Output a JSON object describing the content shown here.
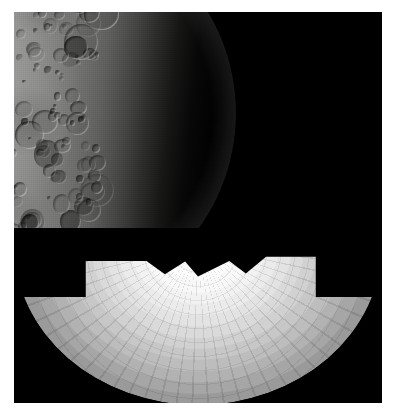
{
  "image": {
    "kind": "astronomical-composite",
    "background_color": "#ffffff",
    "field_color": "#000000",
    "frame": {
      "x": 14,
      "y": 12,
      "width": 368,
      "height": 391
    }
  },
  "upper_object": {
    "name": "cratered-moon",
    "description": "Heavily cratered icy moon, illuminated left hemisphere, terminator on the right",
    "illumination": "left-lit",
    "terminator_side": "right",
    "surface_tone_light": "#bcbcba",
    "surface_tone_mid": "#8a8a88",
    "surface_tone_dark": "#2b2b2a",
    "limb_highlight": "#d8d8d6",
    "bottom_edge": "truncated",
    "features": [
      {
        "name": "elongated-dark-crater",
        "x": 30,
        "y": 148,
        "w": 9,
        "h": 16
      },
      {
        "name": "bright-ray-patch",
        "x": 58,
        "y": 160,
        "w": 24,
        "h": 18
      },
      {
        "name": "terminator-crater-field",
        "x": 150,
        "y": 40,
        "w": 80,
        "h": 180
      }
    ]
  },
  "lower_object": {
    "name": "limb-darkening-sphere-model",
    "description": "Tessellated sphere rendered with concentric photometric brightness bands, brightest at the sub-solar centre",
    "tessellated": true,
    "facet_seams": true,
    "mask_shape": "stepped-batwing-notch",
    "bands": [
      {
        "index": 0,
        "radius_pct": 100,
        "color": "#9a9a9a"
      },
      {
        "index": 1,
        "radius_pct": 93,
        "color": "#a6a6a6"
      },
      {
        "index": 2,
        "radius_pct": 86,
        "color": "#b2b2b2"
      },
      {
        "index": 3,
        "radius_pct": 79,
        "color": "#bdbdbd"
      },
      {
        "index": 4,
        "radius_pct": 72,
        "color": "#c7c7c7"
      },
      {
        "index": 5,
        "radius_pct": 65,
        "color": "#d1d1d1"
      },
      {
        "index": 6,
        "radius_pct": 58,
        "color": "#dadada"
      },
      {
        "index": 7,
        "radius_pct": 51,
        "color": "#e3e3e3"
      },
      {
        "index": 8,
        "radius_pct": 44,
        "color": "#ebebeb"
      },
      {
        "index": 9,
        "radius_pct": 37,
        "color": "#f2f2f2"
      },
      {
        "index": 10,
        "radius_pct": 30,
        "color": "#f8f8f8"
      },
      {
        "index": 11,
        "radius_pct": 22,
        "color": "#fcfcfc"
      },
      {
        "index": 12,
        "radius_pct": 14,
        "color": "#ffffff"
      }
    ]
  },
  "chart_data": {
    "type": "heatmap",
    "title": "",
    "xlabel": "",
    "ylabel": "",
    "x": [
      0,
      14,
      22,
      30,
      37,
      44,
      51,
      58,
      65,
      72,
      79,
      86,
      93,
      100
    ],
    "values": [
      255,
      255,
      252,
      248,
      242,
      235,
      227,
      218,
      209,
      199,
      189,
      178,
      166,
      154
    ],
    "xlim": [
      0,
      100
    ],
    "ylim": [
      0,
      255
    ],
    "grid": false,
    "legend": "none"
  }
}
